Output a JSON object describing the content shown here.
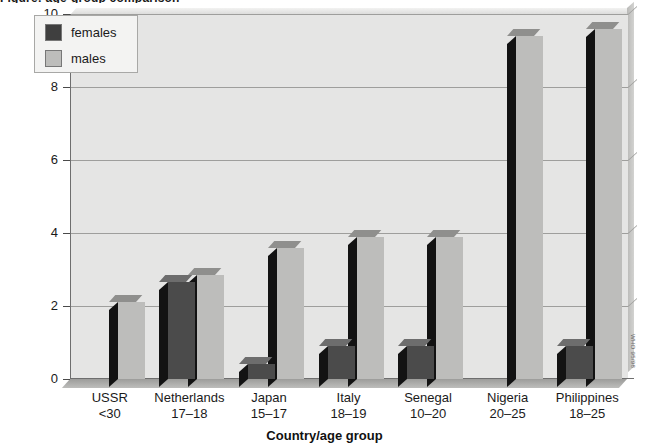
{
  "title_sliver": "Figure: age-group comparison",
  "chart_data": {
    "type": "bar",
    "title": "",
    "xlabel": "Country/age group",
    "ylabel": "",
    "ylim": [
      0,
      10
    ],
    "yticks": [
      0,
      2,
      4,
      6,
      8,
      10
    ],
    "grid": true,
    "legend_position": "top-left",
    "categories": [
      {
        "country": "USSR",
        "age": "<30"
      },
      {
        "country": "Netherlands",
        "age": "17–18"
      },
      {
        "country": "Japan",
        "age": "15–17"
      },
      {
        "country": "Italy",
        "age": "18–19"
      },
      {
        "country": "Senegal",
        "age": "10–20"
      },
      {
        "country": "Nigeria",
        "age": "20–25"
      },
      {
        "country": "Philippines",
        "age": "18–25"
      }
    ],
    "series": [
      {
        "name": "females",
        "color": "#4b4b4b",
        "values": [
          0,
          2.65,
          0.4,
          0.9,
          0.9,
          0,
          0.9
        ]
      },
      {
        "name": "males",
        "color": "#bdbdbb",
        "values": [
          2.1,
          2.85,
          3.6,
          3.9,
          3.9,
          9.4,
          9.6
        ]
      }
    ]
  },
  "legend": {
    "items": [
      {
        "label": "females",
        "swatch": "females"
      },
      {
        "label": "males",
        "swatch": "males"
      }
    ]
  },
  "credit": "WHO 95/98",
  "colors": {
    "females": "#4b4b4b",
    "males": "#bdbdbb",
    "plot_background": "#e5e5e4",
    "gridline": "#9e9e9c"
  }
}
